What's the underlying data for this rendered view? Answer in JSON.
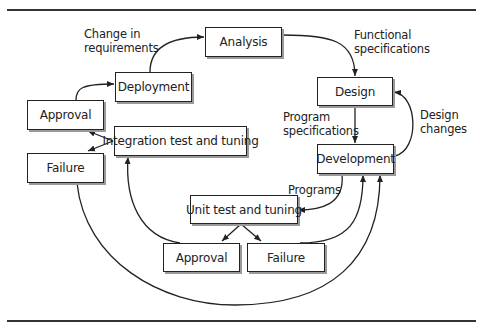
{
  "diagram": {
    "nodes": {
      "analysis": "Analysis",
      "design": "Design",
      "development": "Development",
      "unit_test": "Unit test and tuning",
      "unit_approval": "Approval",
      "unit_failure": "Failure",
      "integration": "Integration test and tuning",
      "integration_approval": "Approval",
      "integration_failure": "Failure",
      "deployment": "Deployment"
    },
    "edge_labels": {
      "functional_specs_1": "Functional",
      "functional_specs_2": "specifications",
      "program_specs_1": "Program",
      "program_specs_2": "specifications",
      "design_changes_1": "Design",
      "design_changes_2": "changes",
      "programs": "Programs",
      "change_req_1": "Change in",
      "change_req_2": "requirements"
    },
    "edges": [
      {
        "from": "analysis",
        "to": "design",
        "label": "Functional specifications"
      },
      {
        "from": "design",
        "to": "development",
        "label": "Program specifications"
      },
      {
        "from": "development",
        "to": "design",
        "label": "Design changes"
      },
      {
        "from": "development",
        "to": "unit_test",
        "label": "Programs"
      },
      {
        "from": "unit_test",
        "to": "unit_approval",
        "label": ""
      },
      {
        "from": "unit_test",
        "to": "unit_failure",
        "label": ""
      },
      {
        "from": "unit_approval",
        "to": "integration",
        "label": ""
      },
      {
        "from": "unit_failure",
        "to": "development",
        "label": ""
      },
      {
        "from": "integration",
        "to": "integration_approval",
        "label": ""
      },
      {
        "from": "integration",
        "to": "integration_failure",
        "label": ""
      },
      {
        "from": "integration_failure",
        "to": "development",
        "label": ""
      },
      {
        "from": "integration_approval",
        "to": "deployment",
        "label": ""
      },
      {
        "from": "deployment",
        "to": "analysis",
        "label": "Change in requirements"
      }
    ],
    "colors": {
      "line": "#222222",
      "shadow": "#9a9a9a",
      "background": "#ffffff"
    }
  }
}
